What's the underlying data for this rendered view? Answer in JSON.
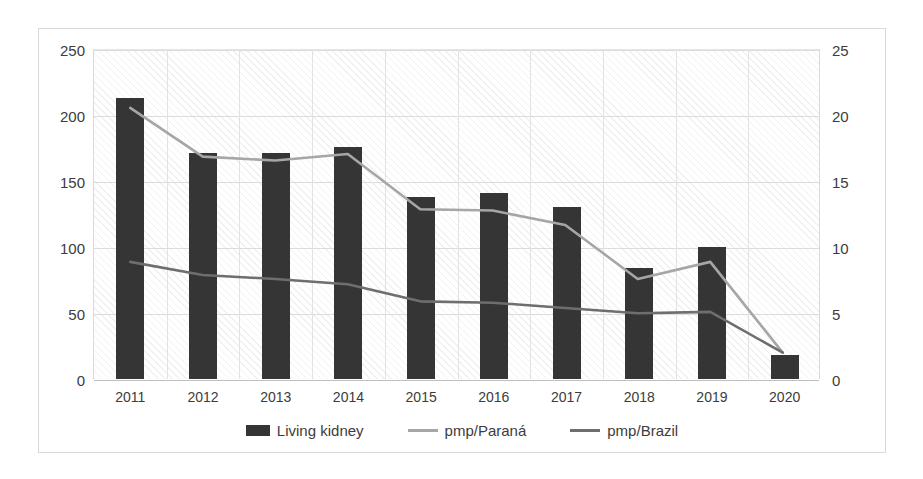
{
  "chart_data": {
    "type": "bar",
    "title": "",
    "xlabel": "",
    "ylabel": "",
    "grid": true,
    "legend_position": "bottom",
    "categories": [
      "2011",
      "2012",
      "2013",
      "2014",
      "2015",
      "2016",
      "2017",
      "2018",
      "2019",
      "2020"
    ],
    "axes": {
      "left": {
        "label": "",
        "ylim": [
          0,
          250
        ],
        "ticks": [
          0,
          50,
          100,
          150,
          200,
          250
        ],
        "tick_labels": [
          "0",
          "50",
          "100",
          "150",
          "200",
          "250"
        ]
      },
      "right": {
        "label": "",
        "ylim": [
          0,
          25
        ],
        "ticks": [
          0,
          5,
          10,
          15,
          20,
          25
        ],
        "tick_labels": [
          "0",
          "5",
          "10",
          "15",
          "20",
          "25"
        ]
      }
    },
    "series": [
      {
        "name": "Living kidney",
        "type": "bar",
        "axis": "left",
        "color": "#353535",
        "values": [
          213,
          171,
          171,
          176,
          138,
          141,
          130,
          84,
          100,
          18
        ]
      },
      {
        "name": "pmp/Paraná",
        "type": "line",
        "axis": "right",
        "color": "#a6a6a6",
        "values": [
          20.6,
          16.9,
          16.6,
          17.1,
          12.9,
          12.8,
          11.7,
          7.6,
          8.9,
          2.0
        ]
      },
      {
        "name": "pmp/Brazil",
        "type": "line",
        "axis": "right",
        "color": "#6e6e6e",
        "values": [
          8.9,
          7.9,
          7.6,
          7.2,
          5.9,
          5.8,
          5.4,
          5.0,
          5.1,
          2.0
        ]
      }
    ]
  },
  "legend": {
    "items": [
      {
        "label": "Living kidney",
        "marker": "bar-swatch",
        "color": "#353535"
      },
      {
        "label": "pmp/Paraná",
        "marker": "line-swatch",
        "color": "#a6a6a6"
      },
      {
        "label": "pmp/Brazil",
        "marker": "line-swatch",
        "color": "#6e6e6e"
      }
    ]
  }
}
